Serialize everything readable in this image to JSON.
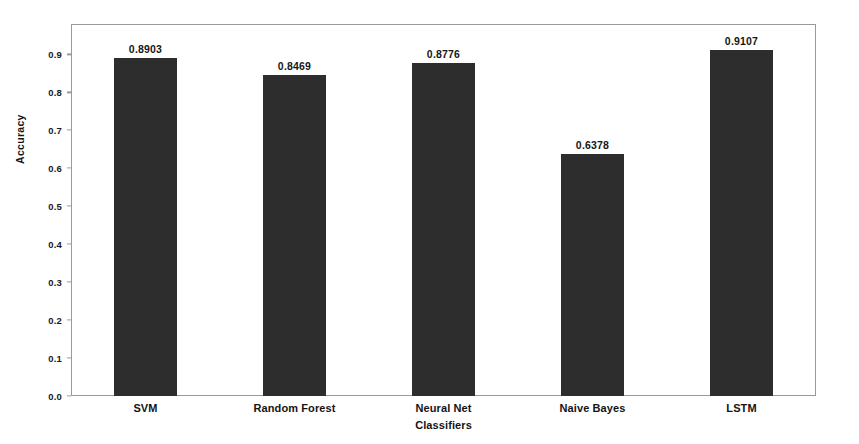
{
  "chart_data": {
    "type": "bar",
    "title": "",
    "subtitle": "",
    "xlabel": "Classifiers",
    "ylabel": "Accuracy",
    "categories": [
      "SVM",
      "Random Forest",
      "Neural Net",
      "Naive Bayes",
      "LSTM"
    ],
    "values": [
      0.8903,
      0.8469,
      0.8776,
      0.6378,
      0.9107
    ],
    "value_labels": [
      "0.8903",
      "0.8469",
      "0.8776",
      "0.6378",
      "0.9107"
    ],
    "ylim": [
      0.0,
      0.98
    ],
    "y_ticks": [
      0.0,
      0.1,
      0.2,
      0.3,
      0.4,
      0.5,
      0.6,
      0.7,
      0.8,
      0.9
    ],
    "y_tick_labels": [
      "0.0",
      "0.1",
      "0.2",
      "0.3",
      "0.4",
      "0.5",
      "0.6",
      "0.7",
      "0.8",
      "0.9"
    ],
    "grid": false,
    "legend": null,
    "legend_position": "none",
    "bar_color": "#2d2d2d",
    "frame_color": "#9a9a9a",
    "background_color": "#ffffff",
    "text_color": "#141414"
  }
}
